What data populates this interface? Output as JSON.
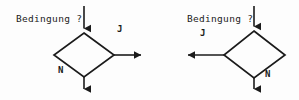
{
  "diagram": {
    "type": "flowchart-decision-pair",
    "background_color": "#fdfdfd",
    "stroke_color": "#1b1b1b",
    "text_color": "#1b1b1b",
    "nodes": [
      {
        "id": "decision-left",
        "shape": "diamond",
        "condition_label": "Bedingung ?",
        "yes_label": "J",
        "no_label": "N",
        "yes_direction": "right",
        "no_direction": "down"
      },
      {
        "id": "decision-right",
        "shape": "diamond",
        "condition_label": "Bedingung ?",
        "yes_label": "J",
        "no_label": "N",
        "yes_direction": "left",
        "no_direction": "down"
      }
    ],
    "left": {
      "condition_text": "Bedingung ?",
      "yes_text": "J",
      "no_text": "N"
    },
    "right": {
      "condition_text": "Bedingung ?",
      "yes_text": "J",
      "no_text": "N"
    }
  }
}
